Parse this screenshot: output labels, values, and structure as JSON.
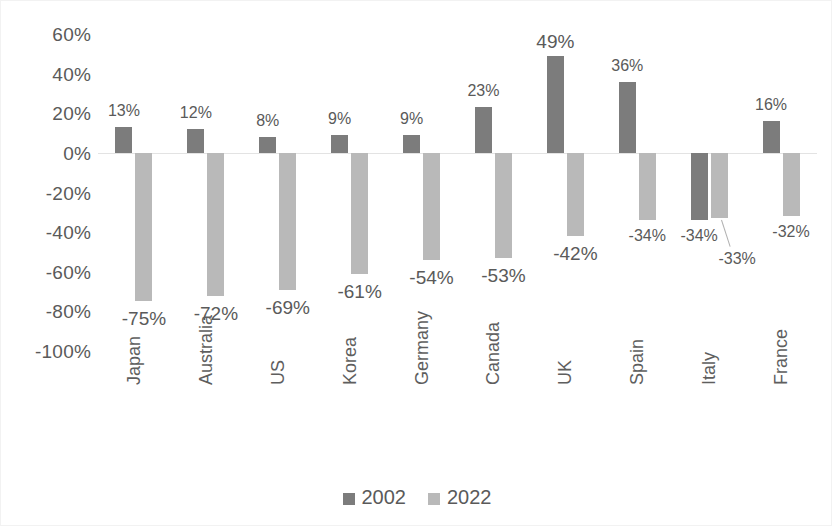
{
  "chart_data": {
    "type": "bar",
    "title": "",
    "subtitle": "",
    "xlabel": "",
    "ylabel": "",
    "ylim": [
      -100,
      60
    ],
    "ytick_labels": [
      "60%",
      "40%",
      "20%",
      "0%",
      "-20%",
      "-40%",
      "-60%",
      "-80%",
      "-100%"
    ],
    "ytick_values": [
      60,
      40,
      20,
      0,
      -20,
      -40,
      -60,
      -80,
      -100
    ],
    "grid": false,
    "legend_position": "bottom",
    "categories": [
      "Japan",
      "Australia",
      "US",
      "Korea",
      "Germany",
      "Canada",
      "UK",
      "Spain",
      "Italy",
      "France"
    ],
    "series": [
      {
        "name": "2002",
        "color": "#7c7c7c",
        "values": [
          13,
          12,
          8,
          9,
          9,
          23,
          49,
          36,
          -34,
          16
        ],
        "labels": [
          "13%",
          "12%",
          "8%",
          "9%",
          "9%",
          "23%",
          "49%",
          "36%",
          "-34%",
          "16%"
        ]
      },
      {
        "name": "2022",
        "color": "#b9b9b9",
        "values": [
          -75,
          -72,
          -69,
          -61,
          -54,
          -53,
          -42,
          -34,
          -33,
          -32
        ],
        "labels": [
          "-75%",
          "-72%",
          "-69%",
          "-61%",
          "-54%",
          "-53%",
          "-42%",
          "-34%",
          "-33%",
          "-32%"
        ]
      }
    ]
  },
  "legend": {
    "items": [
      {
        "label": "2002",
        "color": "#7c7c7c"
      },
      {
        "label": "2022",
        "color": "#b9b9b9"
      }
    ]
  },
  "colors": {
    "series_2002": "#7c7c7c",
    "series_2022": "#b9b9b9",
    "axis_text": "#5a5a5a",
    "zero_line": "#e3e3e3",
    "background": "#ffffff"
  }
}
